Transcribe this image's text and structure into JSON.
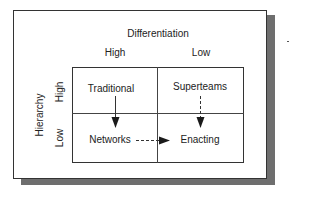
{
  "diagram": {
    "column_axis": {
      "title": "Differentiation",
      "levels": [
        "High",
        "Low"
      ]
    },
    "row_axis": {
      "title": "Hierarchy",
      "levels": [
        "High",
        "Low"
      ]
    },
    "cells": {
      "high_high": "Traditional",
      "high_low": "Superteams",
      "low_high": "Networks",
      "low_low": "Enacting"
    },
    "arrows": [
      {
        "from": "Traditional",
        "to": "Networks",
        "style": "solid"
      },
      {
        "from": "Superteams",
        "to": "Enacting",
        "style": "dashed"
      },
      {
        "from": "Networks",
        "to": "Enacting",
        "style": "dashed"
      }
    ],
    "colors": {
      "line": "#333333",
      "shadow": "#6e6e6e",
      "background": "#ffffff"
    }
  }
}
